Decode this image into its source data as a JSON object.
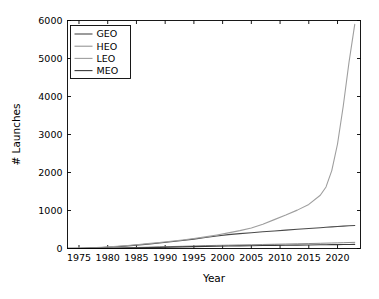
{
  "chart_data": {
    "type": "line",
    "title": "",
    "xlabel": "Year",
    "ylabel": "# Launches",
    "xlim": [
      1973,
      2024
    ],
    "ylim": [
      0,
      6000
    ],
    "xticks": [
      1975,
      1980,
      1985,
      1990,
      1995,
      2000,
      2005,
      2010,
      2015,
      2020
    ],
    "yticks": [
      0,
      1000,
      2000,
      3000,
      4000,
      5000,
      6000
    ],
    "grid": false,
    "legend_position": "upper-left",
    "x": [
      1973,
      1975,
      1977,
      1979,
      1981,
      1983,
      1985,
      1987,
      1989,
      1991,
      1993,
      1995,
      1997,
      1999,
      2001,
      2003,
      2005,
      2007,
      2009,
      2011,
      2013,
      2015,
      2017,
      2018,
      2019,
      2020,
      2021,
      2022,
      2023
    ],
    "series": [
      {
        "name": "GEO",
        "color": "#4a4a4a",
        "width": 1.1,
        "values": [
          2,
          6,
          14,
          26,
          42,
          62,
          88,
          116,
          146,
          178,
          212,
          248,
          288,
          330,
          366,
          392,
          416,
          440,
          462,
          484,
          506,
          528,
          548,
          558,
          568,
          578,
          588,
          598,
          606
        ]
      },
      {
        "name": "HEO",
        "color": "#8c8c8c",
        "width": 1.0,
        "values": [
          1,
          3,
          6,
          10,
          15,
          21,
          28,
          35,
          43,
          51,
          59,
          67,
          75,
          82,
          88,
          94,
          100,
          106,
          112,
          118,
          124,
          130,
          137,
          141,
          145,
          149,
          153,
          158,
          162
        ]
      },
      {
        "name": "LEO",
        "color": "#9e9e9e",
        "width": 1.1,
        "values": [
          4,
          10,
          20,
          34,
          52,
          74,
          100,
          128,
          158,
          190,
          224,
          262,
          306,
          356,
          412,
          470,
          540,
          640,
          760,
          880,
          1010,
          1160,
          1400,
          1620,
          2050,
          2750,
          3750,
          4900,
          5900
        ]
      },
      {
        "name": "MEO",
        "color": "#3a3a3a",
        "width": 1.1,
        "values": [
          0,
          1,
          2,
          4,
          7,
          11,
          16,
          22,
          29,
          36,
          43,
          50,
          56,
          61,
          65,
          69,
          73,
          77,
          81,
          85,
          89,
          93,
          97,
          99,
          101,
          103,
          105,
          107,
          109
        ]
      }
    ]
  },
  "legend": {
    "entries": [
      {
        "label": "GEO"
      },
      {
        "label": "HEO"
      },
      {
        "label": "LEO"
      },
      {
        "label": "MEO"
      }
    ]
  }
}
